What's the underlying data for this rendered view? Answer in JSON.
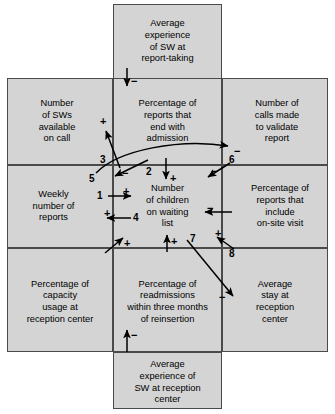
{
  "diagram": {
    "background_color": "#ffffff",
    "cell_fill_color": "#d4d4d4",
    "line_color": "#4a4a4a",
    "cells": [
      {
        "id": "top",
        "label": "Average\nexperience\nof SW at\nreport-taking",
        "text": "Average experience of SW at report-taking"
      },
      {
        "id": "left-top",
        "label": "Number\nof SWs\navailable\non call",
        "text": "Number of SWs available on call"
      },
      {
        "id": "center-top",
        "label": "Percentage of\nreports that\nend with\nadmission",
        "text": "Percentage of reports that end with admission"
      },
      {
        "id": "right-top",
        "label": "Number of\ncalls made\nto validate\nreport",
        "text": "Number of calls made to validate report"
      },
      {
        "id": "left-mid",
        "label": "Weekly\nnumber of\nreports",
        "text": "Weekly number of reports"
      },
      {
        "id": "center-mid",
        "label": "Number\nof children\non waiting\nlist",
        "text": "Number of children on waiting list"
      },
      {
        "id": "right-mid",
        "label": "Percentage of\nreports that\ninclude\non-site visit",
        "text": "Percentage of reports that include on-site visit"
      },
      {
        "id": "left-bottom",
        "label": "Percentage of\ncapacity\nusage at\nreception center",
        "text": "Percentage of capacity usage at reception center"
      },
      {
        "id": "center-bottom",
        "label": "Percentage of\nreadmissions\nwithin three months\nof reinsertion",
        "text": "Percentage of readmissions within three months of reinsertion"
      },
      {
        "id": "right-bottom",
        "label": "Average\nstay at\nreception\ncenter",
        "text": "Average stay at reception center"
      },
      {
        "id": "bottom",
        "label": "Average\nexperience of\nSW at reception\ncenter",
        "text": "Average experience of SW at reception center"
      }
    ],
    "links": [
      {
        "number": "1",
        "sign": "+",
        "from": "Weekly number of reports",
        "to": "Number of children on waiting list"
      },
      {
        "number": "2",
        "sign": "−",
        "from": "Percentage of reports that end with admission",
        "to": "Weekly number of reports"
      },
      {
        "number": "3",
        "sign": "+",
        "from": "Weekly number of reports",
        "to": "Number of SWs available on call"
      },
      {
        "number": "4",
        "sign": "+",
        "from": "Number of children on waiting list",
        "to": "Weekly number of reports"
      },
      {
        "number": "5",
        "sign": "−",
        "from": "Number of SWs available on call",
        "to": "Number of calls made to validate report"
      },
      {
        "number": "6",
        "sign": "−",
        "from": "Number of calls made to validate report",
        "to": "Number of children on waiting list"
      },
      {
        "number": "7",
        "sign": "−",
        "from": "Number of children on waiting list",
        "to": "Average stay at reception center"
      },
      {
        "number": "8",
        "sign": "+",
        "from": "Average stay at reception center",
        "to": "Percentage of reports that include on-site visit"
      }
    ],
    "unnumbered_links": [
      {
        "sign": "−",
        "from": "Average experience of SW at report-taking",
        "to": "Percentage of reports that end with admission"
      },
      {
        "sign": "+",
        "from": "Percentage of reports that end with admission",
        "to": "Number of children on waiting list"
      },
      {
        "sign": "−",
        "from": "Percentage of reports that include on-site visit",
        "to": "Number of children on waiting list"
      },
      {
        "sign": "+",
        "from": "Percentage of capacity usage at reception center",
        "to": "Number of children on waiting list"
      },
      {
        "sign": "+",
        "from": "Percentage of readmissions within three months of reinsertion",
        "to": "Number of children on waiting list"
      },
      {
        "sign": "−",
        "from": "Average experience of SW at reception center",
        "to": "Percentage of readmissions within three months of reinsertion"
      }
    ],
    "signs": {
      "top_minus": "−",
      "plus_left_top": "+",
      "minus_arrow2": "−",
      "plus_center_mid": "+",
      "minus_arrow6_head": "−",
      "minus_arrow5_head": "−",
      "plus_arrow1": "+",
      "plus_arrow4": "+",
      "minus_right_mid": "−",
      "plus_left_bottom": "+",
      "plus_center_bottom": "+",
      "plus_arrow8": "+",
      "minus_arrow7": "−",
      "minus_bottom": "−"
    },
    "numbers": {
      "n1": "1",
      "n2": "2",
      "n3": "3",
      "n4": "4",
      "n5": "5",
      "n6": "6",
      "n7": "7",
      "n8": "8"
    }
  }
}
